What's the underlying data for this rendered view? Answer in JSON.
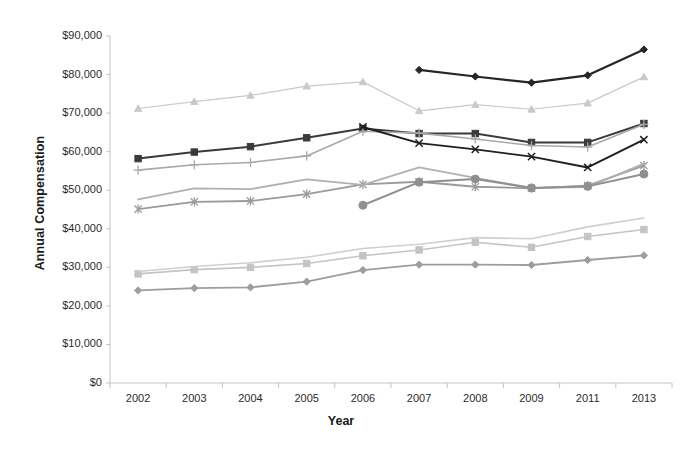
{
  "chart_data": {
    "type": "line",
    "title": "",
    "xlabel": "Year",
    "ylabel": "Annual Compensation",
    "categories": [
      "2002",
      "2003",
      "2004",
      "2005",
      "2006",
      "2007",
      "2008",
      "2009",
      "2011",
      "2013"
    ],
    "ylim": [
      0,
      90000
    ],
    "ytick_labels": [
      "$0",
      "$10,000",
      "$20,000",
      "$30,000",
      "$40,000",
      "$50,000",
      "$60,000",
      "$70,000",
      "$80,000",
      "$90,000"
    ],
    "ytick_values": [
      0,
      10000,
      20000,
      30000,
      40000,
      50000,
      60000,
      70000,
      80000,
      90000
    ],
    "ytick_step": 10000,
    "grid": false,
    "legend": "none",
    "series": [
      {
        "name": "series-diamond-black",
        "marker": "diamond",
        "color": "#262626",
        "width": 2.2,
        "values": [
          null,
          null,
          null,
          null,
          null,
          81200,
          79500,
          77900,
          79800,
          86500
        ]
      },
      {
        "name": "series-triangle-light",
        "marker": "triangle",
        "color": "#c9c9c9",
        "width": 1.2,
        "values": [
          71200,
          73000,
          74600,
          77000,
          78100,
          70600,
          72200,
          71000,
          72600,
          79400
        ]
      },
      {
        "name": "series-square-dark",
        "marker": "square",
        "color": "#3a3a3a",
        "width": 2.0,
        "values": [
          58200,
          59900,
          61300,
          63600,
          66000,
          64700,
          64700,
          62400,
          62400,
          67300
        ]
      },
      {
        "name": "series-plus-gray",
        "marker": "plus",
        "color": "#a8a8a8",
        "width": 1.6,
        "values": [
          55200,
          56600,
          57200,
          58900,
          65300,
          64800,
          63300,
          61600,
          61200,
          67100
        ]
      },
      {
        "name": "series-x-black",
        "marker": "x",
        "color": "#1f1f1f",
        "width": 1.9,
        "values": [
          null,
          null,
          null,
          null,
          66400,
          62200,
          60600,
          58700,
          55900,
          63100
        ]
      },
      {
        "name": "series-star-gray",
        "marker": "star",
        "color": "#9a9a9a",
        "width": 1.8,
        "values": [
          45100,
          47000,
          47200,
          49000,
          51500,
          52200,
          50900,
          50500,
          51200,
          56400
        ]
      },
      {
        "name": "series-line-midgray",
        "marker": "none",
        "color": "#b0b0b0",
        "width": 1.8,
        "values": [
          47600,
          50500,
          50300,
          52800,
          51400,
          55900,
          53200,
          50600,
          50800,
          56900
        ]
      },
      {
        "name": "series-circle-gray",
        "marker": "circle",
        "color": "#8f8f8f",
        "width": 2.0,
        "values": [
          null,
          null,
          null,
          null,
          46100,
          52100,
          52900,
          50600,
          51000,
          54200
        ]
      },
      {
        "name": "series-square-light",
        "marker": "square",
        "color": "#c4c4c4",
        "width": 1.6,
        "values": [
          28300,
          29400,
          30000,
          31000,
          33000,
          34500,
          36500,
          35200,
          38000,
          39800
        ]
      },
      {
        "name": "series-line-lightgray",
        "marker": "none",
        "color": "#cfcfcf",
        "width": 1.6,
        "values": [
          28900,
          30200,
          31200,
          32600,
          34900,
          36000,
          37700,
          37400,
          40500,
          42800
        ]
      },
      {
        "name": "series-diamond-gray",
        "marker": "diamond",
        "color": "#9d9d9d",
        "width": 1.8,
        "values": [
          24000,
          24600,
          24800,
          26300,
          29300,
          30700,
          30700,
          30600,
          31900,
          33100
        ]
      }
    ]
  },
  "axes": {
    "y_axis_name": "Annual Compensation",
    "x_axis_name": "Year"
  }
}
